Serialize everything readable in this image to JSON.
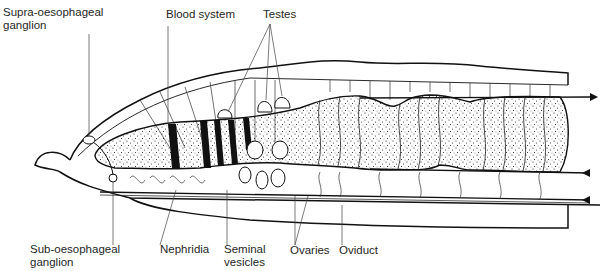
{
  "figure": {
    "labels": {
      "supra_oesophageal": "Supra-oesophageal\nganglion",
      "blood_system": "Blood system",
      "testes": "Testes",
      "sub_oesophageal": "Sub-oesophageal\nganglion",
      "nephridia": "Nephridia",
      "seminal_vesicles": "Seminal\nvesicles",
      "ovaries": "Ovaries",
      "oviduct": "Oviduct"
    },
    "colors": {
      "ink": "#111111",
      "background": "#ffffff",
      "label_text": "#1f1f1f"
    }
  }
}
